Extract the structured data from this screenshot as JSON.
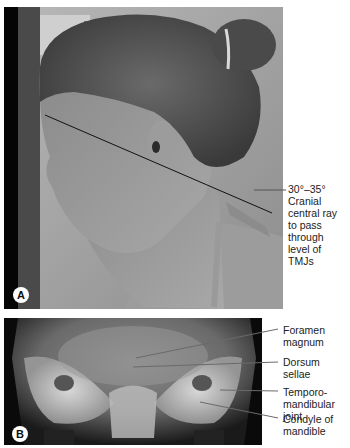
{
  "figure": {
    "panels": [
      {
        "id": "A",
        "badge": "A",
        "description": "Lateral photograph of patient with forehead and nose against image receptor, 30°–35° central ray line drawn through head",
        "annotation": {
          "line1": "30°–35°",
          "line2": "Cranial",
          "line3": "central ray",
          "line4": "to pass",
          "line5": "through",
          "line6": "level of",
          "line7": "TMJs"
        }
      },
      {
        "id": "B",
        "badge": "B",
        "description": "Radiograph of skull base showing TMJ anatomy",
        "labels": [
          {
            "line1": "Foramen",
            "line2": "magnum"
          },
          {
            "line1": "Dorsum",
            "line2": "sellae"
          },
          {
            "line1": "Temporo-",
            "line2": "mandibular joint"
          },
          {
            "line1": "Condyle of",
            "line2": "mandible"
          }
        ]
      }
    ],
    "colors": {
      "background": "#ffffff",
      "label_text": "#222222",
      "leader_line": "#555555",
      "badge_bg": "#ffffff"
    }
  }
}
